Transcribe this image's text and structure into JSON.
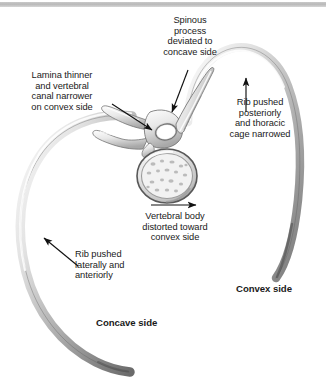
{
  "figure": {
    "background_color": "#ffffff",
    "bone_light": "#f4f4f4",
    "bone_mid": "#c8c8c8",
    "bone_dark": "#6e6e6e",
    "line_color": "#1a1a1a",
    "top_rule_color": "#bdbdbd"
  },
  "labels": {
    "spinous_process": "Spinous\nprocess\ndeviated to\nconcave side",
    "lamina": "Lamina thinner\nand vertebral\ncanal narrower\non convex side",
    "rib_posterior": "Rib pushed\nposteriorly\nand thoracic\ncage narrowed",
    "vertebral_body": "Vertebral body\ndistorted toward\nconvex side",
    "rib_lateral": "Rib pushed\nlaterally and\nanteriorly",
    "concave_side": "Concave side",
    "convex_side": "Convex side"
  },
  "caption": {
    "text": ""
  },
  "anatomy": {
    "vertebral_body": "vertebral-body",
    "vertebral_canal": "vertebral-canal",
    "spinous_process": "spinous-process",
    "transverse_process_left": "transverse-process-left",
    "transverse_process_right": "transverse-process-right",
    "rib_concave": "rib-concave-side",
    "rib_convex": "rib-convex-side"
  },
  "arrows": {
    "spinous_arrow": "arrow-to-spinous-process",
    "lamina_arrow": "arrow-to-lamina",
    "rib_posterior_arrow": "arrow-to-posterior-rib",
    "vertebral_body_arrow": "arrow-toward-convex-side",
    "rib_lateral_arrow": "arrow-to-lateral-rib"
  }
}
